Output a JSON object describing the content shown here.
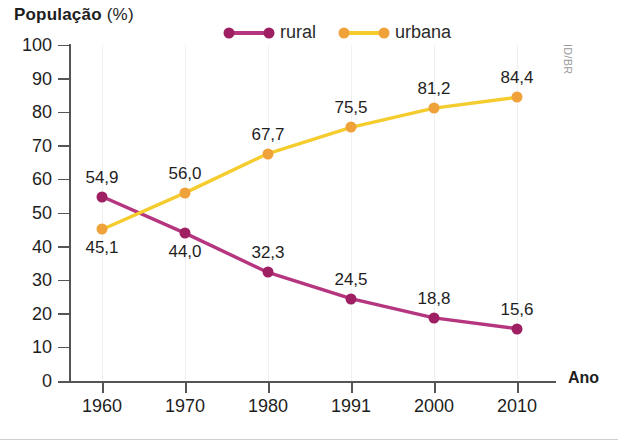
{
  "chart_data": {
    "type": "line",
    "title": "População (%)",
    "title_bold_part": "População",
    "title_regular_part": "(%)",
    "xlabel": "Ano",
    "ylabel": "População (%)",
    "categories": [
      "1960",
      "1970",
      "1980",
      "1991",
      "2000",
      "2010"
    ],
    "ylim": [
      0,
      100
    ],
    "ytick_labels": [
      "0",
      "10",
      "20",
      "30",
      "40",
      "50",
      "60",
      "70",
      "80",
      "90",
      "100"
    ],
    "ytick_values": [
      0,
      10,
      20,
      30,
      40,
      50,
      60,
      70,
      80,
      90,
      100
    ],
    "grid": "vertical-faint",
    "legend_position": "top-center",
    "series": [
      {
        "name": "rural",
        "color": "#b5357f",
        "marker_color": "#9e2063",
        "values": [
          54.9,
          44.0,
          32.3,
          24.5,
          18.8,
          15.6
        ],
        "labels": [
          "54,9",
          "44,0",
          "32,3",
          "24,5",
          "18,8",
          "15,6"
        ],
        "label_positions": [
          "above",
          "below",
          "above",
          "above",
          "above",
          "above"
        ]
      },
      {
        "name": "urbana",
        "color": "#f5cc2e",
        "marker_color": "#f0a23a",
        "values": [
          45.1,
          56.0,
          67.7,
          75.5,
          81.2,
          84.4
        ],
        "labels": [
          "45,1",
          "56,0",
          "67,7",
          "75,5",
          "81,2",
          "84,4"
        ],
        "label_positions": [
          "below",
          "above",
          "above",
          "above",
          "above",
          "above"
        ]
      }
    ]
  },
  "credit": "ID/BR"
}
